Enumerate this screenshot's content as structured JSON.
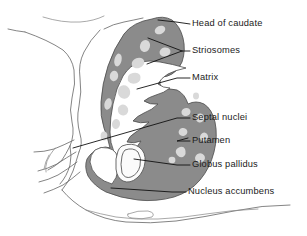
{
  "figure": {
    "background_color": "#ffffff",
    "colors": {
      "striatum_gray": "#8b8b8b",
      "striosome_light": "#d9d9d9",
      "outline_gray": "#6e6e6e",
      "leader_black": "#111111",
      "text_black": "#1b1b1b",
      "white_fill": "#ffffff"
    }
  },
  "labels": [
    {
      "id": "head-of-caudate",
      "text": "Head of caudate",
      "text_x": 192,
      "text_y": 24,
      "leader": "M 190,24 L 175,22 L 158,20",
      "pointer": "dash"
    },
    {
      "id": "striosomes",
      "text": "Striosomes",
      "text_x": 192,
      "text_y": 51,
      "leader": "M 190,51 L 181,51 M 181,51 L 147,38 M 181,51 L 146,63",
      "pointer": "fork"
    },
    {
      "id": "matrix",
      "text": "Matrix",
      "text_x": 192,
      "text_y": 78,
      "leader": "M 190,78 L 176,78 L 137,89",
      "pointer": "dash"
    },
    {
      "id": "septal-nuclei",
      "text": "Septal nuclei",
      "text_x": 192,
      "text_y": 118,
      "leader": "M 190,118 L 176,118 L 73,148",
      "pointer": "dash"
    },
    {
      "id": "putamen",
      "text": "Putamen",
      "text_x": 192,
      "text_y": 141,
      "leader": "M 190,141 L 176,141 L 186,138",
      "pointer": "dash"
    },
    {
      "id": "globus-pallidus",
      "text": "Globus pallidus",
      "text_x": 192,
      "text_y": 165,
      "leader": "M 190,165 L 176,165 L 133,159",
      "pointer": "dash"
    },
    {
      "id": "nucleus-accumbens",
      "text": "Nucleus accumbens",
      "text_x": 188,
      "text_y": 192,
      "leader": "M 186,192 L 172,192 L 111,188",
      "pointer": "dash"
    }
  ],
  "regions": [
    {
      "id": "caudate-head",
      "label_ref": "head-of-caudate"
    },
    {
      "id": "striosome-patches",
      "label_ref": "striosomes",
      "count": 18
    },
    {
      "id": "matrix-body",
      "label_ref": "matrix"
    },
    {
      "id": "septal-nuclei-region",
      "label_ref": "septal-nuclei"
    },
    {
      "id": "putamen-body",
      "label_ref": "putamen"
    },
    {
      "id": "globus-pallidus-body",
      "label_ref": "globus-pallidus"
    },
    {
      "id": "nucleus-accumbens-body",
      "label_ref": "nucleus-accumbens"
    }
  ]
}
